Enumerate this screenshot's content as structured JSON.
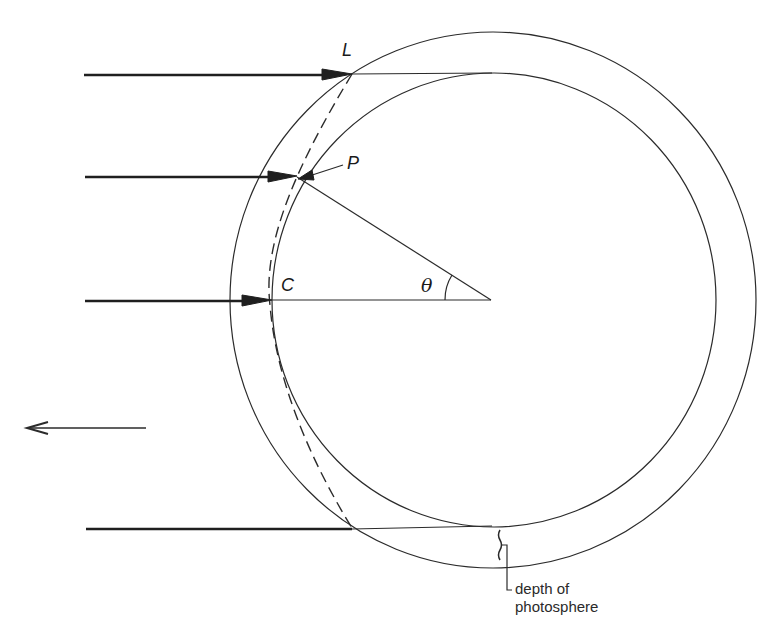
{
  "diagram": {
    "labels": {
      "L": "L",
      "P": "P",
      "C": "C",
      "theta": "θ",
      "depth_line1": "depth of",
      "depth_line2": "photosphere"
    },
    "elements": {
      "outer_circle": {
        "cx": 493,
        "cy": 300,
        "rx": 263,
        "ry": 268
      },
      "inner_circle": {
        "cx": 494,
        "cy": 300,
        "rx": 222,
        "ry": 227
      },
      "center": {
        "x": 491,
        "y": 300
      },
      "rays": [
        {
          "name": "ray-L",
          "y": 75,
          "x_start": 84,
          "x_end": 352,
          "arrow": true
        },
        {
          "name": "ray-P",
          "y": 177,
          "x_start": 85,
          "x_end": 297,
          "arrow": true
        },
        {
          "name": "ray-C",
          "y": 301,
          "x_start": 85,
          "x_end": 272,
          "arrow": true
        },
        {
          "name": "ray-bottom",
          "y": 529,
          "x_start": 86,
          "x_end": 352,
          "arrow": false
        }
      ],
      "direction_arrow": {
        "x_start": 146,
        "x_end": 25,
        "y": 428
      }
    },
    "colors": {
      "line": "#2b2b2b",
      "background": "#ffffff"
    }
  }
}
